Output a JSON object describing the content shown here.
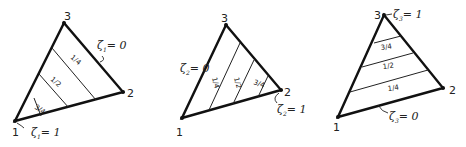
{
  "diagram": {
    "triangles": [
      {
        "name": "zeta-1",
        "vertex_labels": [
          "1",
          "2",
          "3"
        ],
        "iso_labels": [
          "3/4",
          "1/2",
          "1/4"
        ],
        "annotations": [
          {
            "symbol": "ζ",
            "sub": "1",
            "value": "= 0",
            "at": "edge 2-3"
          },
          {
            "symbol": "ζ",
            "sub": "1",
            "value": "= 1",
            "at": "vertex 1"
          }
        ]
      },
      {
        "name": "zeta-2",
        "vertex_labels": [
          "1",
          "2",
          "3"
        ],
        "iso_labels": [
          "1/4",
          "1/2",
          "3/4"
        ],
        "annotations": [
          {
            "symbol": "ζ",
            "sub": "2",
            "value": "= 0",
            "at": "edge 1-3"
          },
          {
            "symbol": "ζ",
            "sub": "2",
            "value": "= 1",
            "at": "vertex 2"
          }
        ]
      },
      {
        "name": "zeta-3",
        "vertex_labels": [
          "1",
          "2",
          "3"
        ],
        "iso_labels": [
          "3/4",
          "1/2",
          "1/4"
        ],
        "annotations": [
          {
            "symbol": "ζ",
            "sub": "3",
            "value": "= 1",
            "at": "vertex 3"
          },
          {
            "symbol": "ζ",
            "sub": "3",
            "value": "= 0",
            "at": "edge 1-2"
          }
        ]
      }
    ]
  }
}
